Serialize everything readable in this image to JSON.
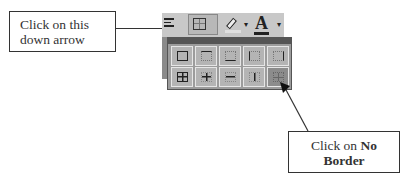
{
  "callouts": {
    "down_arrow": {
      "line1": "Click on this",
      "line2": "down arrow"
    },
    "no_border": {
      "prefix": "Click on ",
      "bold1": "No",
      "bold2": "Border"
    }
  },
  "toolbar": {
    "icons": [
      "align-icon",
      "border-icon",
      "eraser-icon",
      "font-color-icon"
    ],
    "font_color_glyph": "A",
    "dropdown_glyph": "▾"
  },
  "palette": {
    "rows": [
      [
        "outside-borders",
        "top-border",
        "bottom-border",
        "left-border",
        "right-border"
      ],
      [
        "all-borders",
        "inside-borders",
        "inside-horizontal-border",
        "inside-vertical-border",
        "no-border"
      ]
    ],
    "selected": "no-border"
  }
}
